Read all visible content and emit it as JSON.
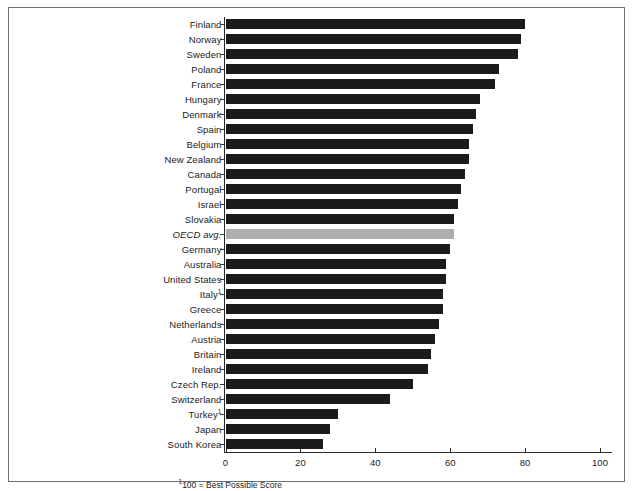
{
  "figure": {
    "background_color": "#ffffff",
    "frame_color": "#6e6e6e",
    "bar_color": "#1b1b1b",
    "highlight_bar_color": "#aeaeae",
    "axis_color": "#2b2b2b",
    "footnote": "100 = Best Possible Score",
    "footnote_marker": "1"
  },
  "chart_data": {
    "type": "bar",
    "orientation": "horizontal",
    "title": "",
    "subtitle": "",
    "xlabel": "",
    "ylabel": "",
    "xlim": [
      0,
      100
    ],
    "xticks": [
      0,
      20,
      40,
      60,
      80,
      100
    ],
    "xtick_labels": [
      "0",
      "20",
      "40",
      "60",
      "80",
      "100"
    ],
    "grid": false,
    "legend": false,
    "annotations": [
      "100 = Best Possible Score"
    ],
    "categories": [
      "Finland",
      "Norway",
      "Sweden",
      "Poland",
      "France",
      "Hungary",
      "Denmark",
      "Spain",
      "Belgium",
      "New Zealand",
      "Canada",
      "Portugal",
      "Israel",
      "Slovakia",
      "OECD avg.",
      "Germany",
      "Australia",
      "United States",
      "Italy",
      "Greece",
      "Netherlands",
      "Austria",
      "Britain",
      "Ireland",
      "Czech Rep.",
      "Switzerland",
      "Turkey",
      "Japan",
      "South Korea"
    ],
    "values": [
      80,
      79,
      78,
      73,
      72,
      68,
      67,
      66,
      65,
      65,
      64,
      63,
      62,
      61,
      61,
      60,
      59,
      59,
      58,
      58,
      57,
      56,
      55,
      54,
      50,
      44,
      30,
      28,
      26
    ],
    "markers": {
      "Italy": "1",
      "Turkey": "1"
    },
    "highlight_category": "OECD avg."
  }
}
